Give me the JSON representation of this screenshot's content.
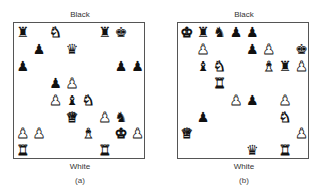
{
  "diagrams": [
    {
      "id": "a",
      "top_label": "Black",
      "bottom_label": "White",
      "caption": "(a)",
      "pieces": [
        {
          "square": "a8",
          "color": "black",
          "type": "rook",
          "glyph": "♜"
        },
        {
          "square": "c8",
          "color": "white",
          "type": "knight",
          "glyph": "♞"
        },
        {
          "square": "f8",
          "color": "black",
          "type": "rook",
          "glyph": "♜"
        },
        {
          "square": "g8",
          "color": "black",
          "type": "king",
          "glyph": "♚"
        },
        {
          "square": "b7",
          "color": "black",
          "type": "pawn",
          "glyph": "♟"
        },
        {
          "square": "d7",
          "color": "black",
          "type": "queen",
          "glyph": "♛"
        },
        {
          "square": "a6",
          "color": "black",
          "type": "pawn",
          "glyph": "♟"
        },
        {
          "square": "g6",
          "color": "black",
          "type": "pawn",
          "glyph": "♟"
        },
        {
          "square": "h6",
          "color": "black",
          "type": "pawn",
          "glyph": "♟"
        },
        {
          "square": "c5",
          "color": "black",
          "type": "pawn",
          "glyph": "♟"
        },
        {
          "square": "d5",
          "color": "white",
          "type": "pawn",
          "glyph": "♟"
        },
        {
          "square": "c4",
          "color": "white",
          "type": "pawn",
          "glyph": "♟"
        },
        {
          "square": "d4",
          "color": "black",
          "type": "bishop",
          "glyph": "♝"
        },
        {
          "square": "e4",
          "color": "white",
          "type": "knight",
          "glyph": "♞"
        },
        {
          "square": "d3",
          "color": "white",
          "type": "queen",
          "glyph": "♛"
        },
        {
          "square": "f3",
          "color": "white",
          "type": "pawn",
          "glyph": "♟"
        },
        {
          "square": "g3",
          "color": "black",
          "type": "knight",
          "glyph": "♞"
        },
        {
          "square": "a2",
          "color": "white",
          "type": "pawn",
          "glyph": "♟"
        },
        {
          "square": "b2",
          "color": "white",
          "type": "pawn",
          "glyph": "♟"
        },
        {
          "square": "e2",
          "color": "white",
          "type": "bishop",
          "glyph": "♝"
        },
        {
          "square": "g2",
          "color": "white",
          "type": "king",
          "glyph": "♚"
        },
        {
          "square": "h2",
          "color": "white",
          "type": "pawn",
          "glyph": "♟"
        },
        {
          "square": "a1",
          "color": "white",
          "type": "rook",
          "glyph": "♜"
        },
        {
          "square": "f1",
          "color": "white",
          "type": "rook",
          "glyph": "♜"
        }
      ]
    },
    {
      "id": "b",
      "top_label": "Black",
      "bottom_label": "White",
      "caption": "(b)",
      "pieces": [
        {
          "square": "a8",
          "color": "white",
          "type": "king",
          "glyph": "♚"
        },
        {
          "square": "b8",
          "color": "black",
          "type": "rook",
          "glyph": "♜"
        },
        {
          "square": "c8",
          "color": "black",
          "type": "knight",
          "glyph": "♞"
        },
        {
          "square": "d8",
          "color": "black",
          "type": "pawn",
          "glyph": "♟"
        },
        {
          "square": "e8",
          "color": "black",
          "type": "pawn",
          "glyph": "♟"
        },
        {
          "square": "b7",
          "color": "white",
          "type": "pawn",
          "glyph": "♟"
        },
        {
          "square": "e7",
          "color": "black",
          "type": "pawn",
          "glyph": "♟"
        },
        {
          "square": "f7",
          "color": "white",
          "type": "pawn",
          "glyph": "♟"
        },
        {
          "square": "h7",
          "color": "black",
          "type": "king",
          "glyph": "♚"
        },
        {
          "square": "b6",
          "color": "black",
          "type": "bishop",
          "glyph": "♝"
        },
        {
          "square": "c6",
          "color": "white",
          "type": "knight",
          "glyph": "♞"
        },
        {
          "square": "f6",
          "color": "white",
          "type": "bishop",
          "glyph": "♝"
        },
        {
          "square": "g6",
          "color": "black",
          "type": "rook",
          "glyph": "♜"
        },
        {
          "square": "h6",
          "color": "white",
          "type": "pawn",
          "glyph": "♟"
        },
        {
          "square": "c5",
          "color": "white",
          "type": "rook",
          "glyph": "♜"
        },
        {
          "square": "d4",
          "color": "white",
          "type": "pawn",
          "glyph": "♟"
        },
        {
          "square": "e4",
          "color": "black",
          "type": "pawn",
          "glyph": "♟"
        },
        {
          "square": "g4",
          "color": "white",
          "type": "pawn",
          "glyph": "♟"
        },
        {
          "square": "b3",
          "color": "black",
          "type": "pawn",
          "glyph": "♟"
        },
        {
          "square": "g3",
          "color": "white",
          "type": "knight",
          "glyph": "♞"
        },
        {
          "square": "a2",
          "color": "white",
          "type": "queen",
          "glyph": "♛"
        },
        {
          "square": "h2",
          "color": "white",
          "type": "pawn",
          "glyph": "♟"
        },
        {
          "square": "e1",
          "color": "black",
          "type": "queen",
          "glyph": "♛"
        },
        {
          "square": "g1",
          "color": "white",
          "type": "rook",
          "glyph": "♜"
        }
      ]
    }
  ]
}
